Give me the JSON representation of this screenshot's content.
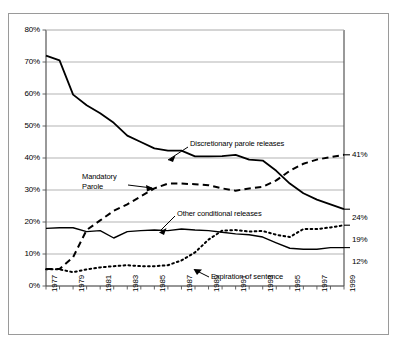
{
  "chart_data": {
    "type": "line",
    "title": "",
    "subtitle": "",
    "xlabel": "",
    "ylabel": "",
    "xlim": [
      1977,
      1999
    ],
    "ylim": [
      0,
      80
    ],
    "grid": true,
    "legend_position": "inline-callouts",
    "y_ticks": [
      "0%",
      "10%",
      "20%",
      "30%",
      "40%",
      "50%",
      "60%",
      "70%",
      "80%"
    ],
    "y_tick_values": [
      0,
      10,
      20,
      30,
      40,
      50,
      60,
      70,
      80
    ],
    "x_ticks": [
      "1977",
      "1979",
      "1981",
      "1983",
      "1985",
      "1987",
      "1989",
      "1991",
      "1993",
      "1995",
      "1997",
      "1999"
    ],
    "x_tick_values": [
      1977,
      1979,
      1981,
      1983,
      1985,
      1987,
      1989,
      1991,
      1993,
      1995,
      1997,
      1999
    ],
    "x": [
      1977,
      1978,
      1979,
      1980,
      1981,
      1982,
      1983,
      1984,
      1985,
      1986,
      1987,
      1988,
      1989,
      1990,
      1991,
      1992,
      1993,
      1994,
      1995,
      1996,
      1997,
      1998,
      1999
    ],
    "series": [
      {
        "name": "Discretionary parole releases",
        "style": "solid",
        "color": "#000000",
        "width": 1.8,
        "end_label": "24%",
        "values": [
          72,
          70.5,
          59.8,
          56.5,
          54,
          51,
          47,
          45,
          43,
          42.3,
          42.3,
          40.5,
          40.5,
          40.6,
          41,
          39.5,
          39.2,
          36,
          32,
          29,
          27,
          25.5,
          24
        ]
      },
      {
        "name": "Mandatory Parole",
        "style": "dashed",
        "color": "#000000",
        "width": 2.0,
        "end_label": "41%",
        "values": [
          5.3,
          5.3,
          9,
          17.5,
          20.5,
          23.5,
          25.5,
          28,
          30.5,
          32,
          32,
          31.8,
          31.5,
          30.5,
          29.8,
          30.5,
          31,
          33,
          36,
          38.2,
          39.5,
          40.3,
          41
        ]
      },
      {
        "name": "Other conditional releases",
        "style": "solid",
        "color": "#000000",
        "width": 1.4,
        "end_label": "12%",
        "values": [
          18,
          18.2,
          18.2,
          17,
          17.3,
          15,
          17,
          17.3,
          17.5,
          17.3,
          17.8,
          17.5,
          17.3,
          16.8,
          16.3,
          16,
          15.3,
          13.5,
          11.8,
          11.5,
          11.5,
          12,
          12
        ]
      },
      {
        "name": "Expiration of sentence",
        "style": "dotted",
        "color": "#000000",
        "width": 2.0,
        "end_label": "19%",
        "values": [
          5.2,
          5.2,
          4.3,
          5.2,
          5.8,
          6.2,
          6.5,
          6.2,
          6.2,
          6.5,
          8,
          10.5,
          14.5,
          17.3,
          17.5,
          17,
          17.2,
          16,
          15.3,
          17.8,
          17.8,
          18.3,
          19
        ]
      }
    ],
    "annotations": [
      {
        "text": "Discretionary parole releases",
        "series": "Discretionary parole releases"
      },
      {
        "text": "Mandatory\nParole",
        "series": "Mandatory Parole",
        "line1": "Mandatory",
        "line2": "Parole"
      },
      {
        "text": "Other conditional releases",
        "series": "Other conditional releases"
      },
      {
        "text": "Expiration of sentence",
        "series": "Expiration of sentence"
      }
    ],
    "end_labels": [
      {
        "label": "41%",
        "value": 41
      },
      {
        "label": "24%",
        "value": 24
      },
      {
        "label": "19%",
        "value": 19
      },
      {
        "label": "12%",
        "value": 12
      }
    ]
  },
  "axis": {
    "y_labels": [
      "80%",
      "70%",
      "60%",
      "50%",
      "40%",
      "30%",
      "20%",
      "10%",
      "0%"
    ],
    "x_labels": [
      "1977",
      "1979",
      "1981",
      "1983",
      "1985",
      "1987",
      "1989",
      "1991",
      "1993",
      "1995",
      "1997",
      "1999"
    ]
  },
  "callouts": {
    "discretionary": "Discretionary parole releases",
    "mandatory_line1": "Mandatory",
    "mandatory_line2": "Parole",
    "other": "Other conditional releases",
    "expiration": "Expiration of sentence"
  },
  "end_labels": {
    "mandatory": "41%",
    "discretionary": "24%",
    "expiration": "19%",
    "other": "12%"
  },
  "colors": {
    "line": "#000000",
    "grid": "#aaaaaa",
    "axis": "#555555",
    "border": "#9a9a9a",
    "background": "#ffffff"
  }
}
